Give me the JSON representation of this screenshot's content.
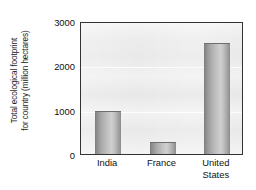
{
  "chart_data": {
    "type": "bar",
    "title": "",
    "subtitle": "",
    "xlabel": "",
    "ylabel": "Total ecological footprint for country (million hectares)",
    "ylabel_lines": [
      "Total ecological footprint",
      "for country (million hectares)"
    ],
    "categories": [
      "India",
      "France",
      "United States"
    ],
    "category_lines": [
      [
        "India"
      ],
      [
        "France"
      ],
      [
        "United",
        "States"
      ]
    ],
    "values": [
      960,
      270,
      2500
    ],
    "ylim": [
      0,
      3000
    ],
    "yticks": [
      0,
      1000,
      2000,
      3000
    ],
    "ytick_labels": [
      "0",
      "1000",
      "2000",
      "3000"
    ],
    "grid": true,
    "grid_axis": "y",
    "legend": false,
    "legend_position": "none",
    "series": [
      {
        "name": "Total ecological footprint",
        "values": [
          960,
          270,
          2500
        ]
      }
    ],
    "colors": {
      "bar_dark_edge": "#7d7d7d",
      "bar_light_center": "#cfcfcf",
      "plot_background": "#e9e9e9",
      "frame": "#333333",
      "gridline": "#ffffff",
      "text": "#111111",
      "page_background": "#ffffff"
    }
  }
}
